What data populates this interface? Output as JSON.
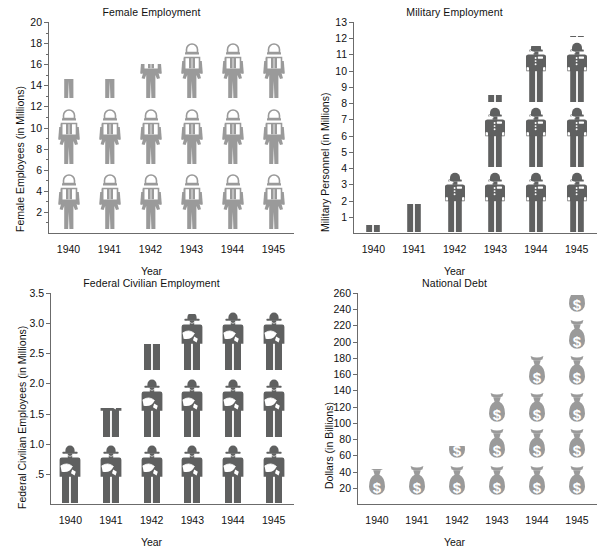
{
  "figure": {
    "panels": [
      "female",
      "military",
      "civilian",
      "debt"
    ],
    "common_xlabel": "Year",
    "years": [
      "1940",
      "1941",
      "1942",
      "1943",
      "1944",
      "1945"
    ],
    "colors": {
      "light_gray": "#9a9a9a",
      "dark_gray": "#5f6060",
      "axis": "#6b6b6b",
      "text": "#111111",
      "white": "#ffffff"
    }
  },
  "chart_data": [
    {
      "id": "female",
      "type": "bar",
      "pictogram": "female-worker-icon",
      "title": "Female Employment",
      "xlabel": "Year",
      "ylabel": "Female Employees (in Millions)",
      "categories": [
        "1940",
        "1941",
        "1942",
        "1943",
        "1944",
        "1945"
      ],
      "values": [
        14.6,
        14.6,
        16.0,
        18.6,
        19.0,
        19.0
      ],
      "unit_per_icon": 6.2,
      "ylim": [
        0,
        20
      ],
      "yticks": [
        2,
        4,
        6,
        8,
        10,
        12,
        14,
        16,
        18,
        20
      ],
      "yticklabels": [
        "2",
        "4",
        "6",
        "8",
        "10",
        "12",
        "14",
        "16",
        "18",
        "20"
      ],
      "minor_ticks": true,
      "grid": false,
      "legend": "none"
    },
    {
      "id": "military",
      "type": "bar",
      "pictogram": "soldier-icon",
      "title": "Military Employment",
      "xlabel": "Year",
      "ylabel": "Military Personnel (in Millions)",
      "categories": [
        "1940",
        "1941",
        "1942",
        "1943",
        "1944",
        "1945"
      ],
      "values": [
        0.5,
        1.8,
        3.8,
        8.5,
        11.5,
        12.1
      ],
      "unit_per_icon": 4.0,
      "ylim": [
        0,
        13
      ],
      "yticks": [
        1,
        2,
        3,
        4,
        5,
        6,
        7,
        8,
        9,
        10,
        11,
        12,
        13
      ],
      "yticklabels": [
        "1",
        "2",
        "3",
        "4",
        "5",
        "6",
        "7",
        "8",
        "9",
        "10",
        "11",
        "12",
        "13"
      ],
      "minor_ticks": false,
      "grid": false,
      "legend": "none"
    },
    {
      "id": "civilian",
      "type": "bar",
      "pictogram": "civilian-clerk-icon",
      "title": "Federal Civilian Employment",
      "xlabel": "Year",
      "ylabel": "Federal Civilian Employees (in Millions)",
      "categories": [
        "1940",
        "1941",
        "1942",
        "1943",
        "1944",
        "1945"
      ],
      "values": [
        1.02,
        1.6,
        2.65,
        3.16,
        3.3,
        3.3
      ],
      "unit_per_icon": 1.1,
      "ylim": [
        0,
        3.5
      ],
      "yticks": [
        0.5,
        1.0,
        1.5,
        2.0,
        2.5,
        3.0,
        3.5
      ],
      "yticklabels": [
        ".5",
        "1.0",
        "1.5",
        "2.0",
        "2.5",
        "3.0",
        "3.5"
      ],
      "minor_ticks": false,
      "grid": false,
      "legend": "none"
    },
    {
      "id": "debt",
      "type": "bar",
      "pictogram": "money-bag-icon",
      "title": "National Debt",
      "xlabel": "Year",
      "ylabel": "Dollars (in Billions)",
      "categories": [
        "1940",
        "1941",
        "1942",
        "1943",
        "1944",
        "1945"
      ],
      "values": [
        43,
        50,
        72,
        136,
        190,
        258
      ],
      "unit_per_icon": 45,
      "ylim": [
        0,
        260
      ],
      "yticks": [
        20,
        40,
        60,
        80,
        100,
        120,
        140,
        160,
        180,
        200,
        220,
        240,
        260
      ],
      "yticklabels": [
        "20",
        "40",
        "60",
        "80",
        "100",
        "120",
        "140",
        "160",
        "180",
        "200",
        "220",
        "240",
        "260"
      ],
      "minor_ticks": false,
      "grid": false,
      "legend": "none"
    }
  ]
}
